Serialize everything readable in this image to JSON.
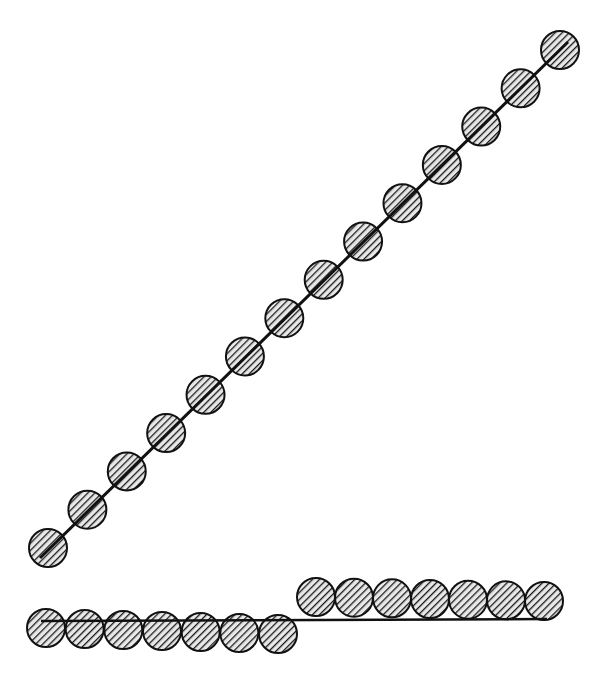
{
  "diagram": {
    "colors": {
      "background": "#ffffff",
      "stroke": "#111111",
      "fill": "#9a9a9a",
      "hatch": "#1a1a1a"
    },
    "circle_radius": 19,
    "diagonal_chain": {
      "line": {
        "x1": 40,
        "y1": 558,
        "x2": 568,
        "y2": 42
      },
      "count": 14,
      "start": [
        48,
        548
      ],
      "end": [
        560,
        50
      ]
    },
    "horizontal_chain": {
      "line": {
        "x1": 41,
        "y1": 621,
        "x2": 547,
        "y2": 619
      },
      "lower_row": {
        "count": 7,
        "start": [
          46,
          628
        ],
        "end": [
          278,
          634
        ]
      },
      "upper_row": {
        "count": 7,
        "start": [
          316,
          597
        ],
        "end": [
          544,
          601
        ]
      }
    }
  }
}
